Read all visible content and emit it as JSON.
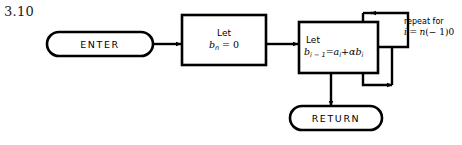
{
  "figure": {
    "label": "3.10",
    "type": "flowchart"
  },
  "nodes": {
    "enter": {
      "shape": "terminator",
      "label": "ENTER"
    },
    "init": {
      "shape": "process",
      "line1": "Let",
      "line2_var": "b",
      "line2_sub": "n",
      "line2_rest": "= 0"
    },
    "accumulate": {
      "shape": "process",
      "line1": "Let",
      "line2_lhs_var": "b",
      "line2_lhs_sub": "i − 1",
      "line2_eq": "=",
      "line2_rhs_a": "a",
      "line2_rhs_a_sub": "i",
      "line2_plus": "+",
      "line2_alpha": "α",
      "line2_rhs_b": "b",
      "line2_rhs_b_sub": "i"
    },
    "return": {
      "shape": "terminator",
      "label": "RETURN"
    }
  },
  "annotations": {
    "repeat": {
      "line1": "repeat for",
      "line2_i": "i",
      "line2_eq": "=",
      "line2_n": "n",
      "line2_range": "(− 1)0"
    }
  },
  "colors": {
    "ink": "#000000",
    "background": "#ffffff",
    "label_ink": "#1a1a1a"
  }
}
